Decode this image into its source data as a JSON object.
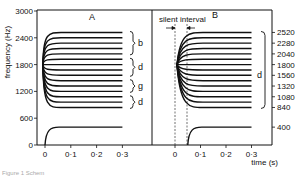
{
  "chart_data": [
    {
      "panel": "A",
      "type": "line",
      "title": "A",
      "xlabel": "",
      "ylabel": "frequency (Hz)",
      "xlim": [
        -0.03,
        0.33
      ],
      "ylim": [
        0,
        3000
      ],
      "x_ticks": [
        "0",
        "0·1",
        "0·2",
        "0·3"
      ],
      "y_ticks": [
        "0",
        "600",
        "1200",
        "1800",
        "2400",
        "3000"
      ],
      "grid": false,
      "description": "F2 transitions diverging from a common locus (~1800 Hz) at t=0 to steady-state values; F1 rises from 0 to ~400 Hz",
      "locus_hz": 1800,
      "f1": {
        "start_hz": 0,
        "steady_hz": 400,
        "start_time": 0,
        "end_time": 0.3
      },
      "f2_steady_hz": [
        2520,
        2400,
        2280,
        2160,
        2040,
        1920,
        1800,
        1680,
        1560,
        1440,
        1320,
        1200,
        1080,
        960,
        840
      ],
      "brackets": [
        {
          "label": "b",
          "from_hz": 2520,
          "to_hz": 2040
        },
        {
          "label": "d",
          "from_hz": 1920,
          "to_hz": 1560
        },
        {
          "label": "g",
          "from_hz": 1440,
          "to_hz": 1200
        },
        {
          "label": "d",
          "from_hz": 1080,
          "to_hz": 840
        }
      ]
    },
    {
      "panel": "B",
      "type": "line",
      "title": "B",
      "xlabel": "time (s)",
      "ylabel": "",
      "xlim": [
        -0.03,
        0.33
      ],
      "ylim": [
        0,
        3000
      ],
      "x_ticks": [
        "0",
        "0·1",
        "0·2",
        "0·3"
      ],
      "annotation": "silent interval",
      "silent_interval_s": [
        0,
        0.05
      ],
      "right_axis_labels": [
        "2520",
        "2280",
        "2040",
        "1800",
        "1560",
        "1320",
        "1080",
        "840",
        "400"
      ],
      "f1": {
        "start_hz": 0,
        "steady_hz": 400,
        "start_time": 0.05,
        "end_time": 0.3
      },
      "f2_steady_hz": [
        2520,
        2400,
        2280,
        2160,
        2040,
        1920,
        1800,
        1680,
        1560,
        1440,
        1320,
        1200,
        1080,
        960,
        840
      ],
      "brackets": [
        {
          "label": "d",
          "from_hz": 2520,
          "to_hz": 840
        }
      ]
    }
  ],
  "labels": {
    "panel_a": "A",
    "panel_b": "B",
    "ylabel": "frequency (Hz)",
    "xlabel": "time (s)",
    "silent_interval": "silent interval",
    "y_ticks": [
      "3000",
      "2400",
      "1800",
      "1200",
      "600",
      "0"
    ],
    "x_ticks_a": [
      "0",
      "0·1",
      "0·2",
      "0·3"
    ],
    "x_ticks_b": [
      "0",
      "0·1",
      "0·2",
      "0·3"
    ],
    "right_ticks": [
      "2520",
      "2280",
      "2040",
      "1800",
      "1560",
      "1320",
      "1080",
      "840",
      "400"
    ],
    "brackets_a": [
      "b",
      "d",
      "g",
      "d"
    ],
    "bracket_b": "d",
    "caption": "Figure 1  Schem"
  }
}
